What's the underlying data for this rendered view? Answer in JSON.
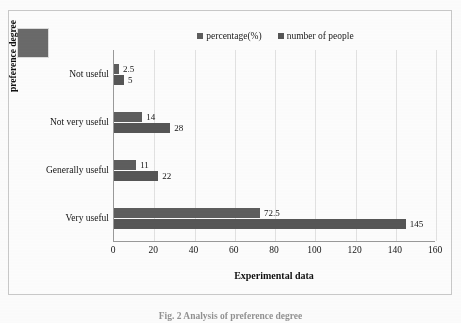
{
  "figure": {
    "caption": "Fig. 2   Analysis of preference degree",
    "artifact_color": "#6a6a6a"
  },
  "chart_data": {
    "type": "bar",
    "orientation": "horizontal",
    "title": "",
    "xlabel": "Experimental data",
    "ylabel": "preference degree",
    "categories": [
      "Not  useful",
      "Not very useful",
      "Generally useful",
      "Very useful"
    ],
    "series": [
      {
        "name": "percentage(%)",
        "color": "#5e5e5e",
        "values": [
          2.5,
          14,
          11,
          72.5
        ],
        "labels": [
          "2.5",
          "14",
          "11",
          "72.5"
        ]
      },
      {
        "name": "number of people",
        "color": "#565656",
        "values": [
          5,
          28,
          22,
          145
        ],
        "labels": [
          "5",
          "28",
          "22",
          "145"
        ]
      }
    ],
    "xlim": [
      0,
      160
    ],
    "xticks": [
      0,
      20,
      40,
      60,
      80,
      100,
      120,
      140,
      160
    ],
    "xticklabels": [
      "0",
      "20",
      "40",
      "60",
      "80",
      "100",
      "120",
      "140",
      "160"
    ],
    "grid": "vertical",
    "legend_position": "top-center"
  }
}
